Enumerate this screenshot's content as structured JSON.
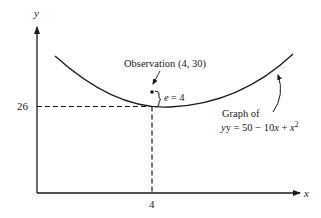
{
  "diagram": {
    "axes": {
      "x_label": "x",
      "y_label": "y"
    },
    "ticks": {
      "x_tick": "4",
      "y_tick": "26"
    },
    "observation": {
      "label": "Observation (4, 30)",
      "point": [
        4,
        30
      ]
    },
    "error": {
      "symbol": "e",
      "equals": "= 4"
    },
    "curve": {
      "caption_line1": "Graph of",
      "equation_prefix": "y = 50 − 10",
      "equation_x": "x",
      "equation_plus": " + ",
      "equation_x2": "x",
      "equation_exp": "2"
    }
  },
  "colors": {
    "ink": "#1a1a1a",
    "background": "#ffffff"
  }
}
